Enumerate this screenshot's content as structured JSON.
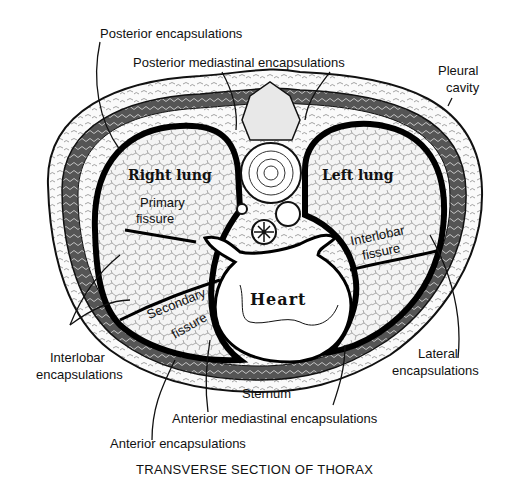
{
  "diagram": {
    "title": "TRANSVERSE SECTION OF THORAX",
    "organs": {
      "right_lung": "Right lung",
      "left_lung": "Left lung",
      "heart": "Heart"
    },
    "labels": {
      "posterior_encapsulations": "Posterior encapsulations",
      "posterior_mediastinal_encapsulations": "Posterior mediastinal encapsulations",
      "pleural_cavity_line1": "Pleural",
      "pleural_cavity_line2": "cavity",
      "primary_fissure_line1": "Primary",
      "primary_fissure_line2": "fissure",
      "interlobar_fissure_line1": "Interlobar",
      "interlobar_fissure_line2": "fissure",
      "secondary_fissure_line1": "Secondary",
      "secondary_fissure_line2": "fissure",
      "interlobar_encapsulations_line1": "Interlobar",
      "interlobar_encapsulations_line2": "encapsulations",
      "lateral_encapsulations_line1": "Lateral",
      "lateral_encapsulations_line2": "encapsulations",
      "sternum": "Sternum",
      "anterior_mediastinal_encapsulations": "Anterior mediastinal encapsulations",
      "anterior_encapsulations": "Anterior encapsulations"
    }
  }
}
